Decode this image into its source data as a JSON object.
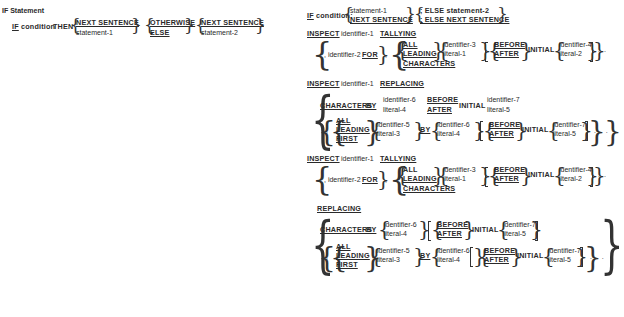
{
  "if_statement": {
    "title": "IF Statement",
    "format1": {
      "if": "IF",
      "condition": "condition",
      "then": "THEN",
      "choice1": [
        "NEXT SENTENCE",
        "statement-1"
      ],
      "choice2": [
        "OTHERWISE",
        "ELSE"
      ],
      "choice3": [
        "NEXT SENTENCE",
        "statement-2"
      ]
    },
    "format2": {
      "if": "IF",
      "condition": "condition;",
      "choice1": [
        "statement-1",
        "NEXT SENTENCE"
      ],
      "choice2": [
        "; ELSE statement-2",
        "; ELSE NEXT SENTENCE"
      ]
    }
  },
  "inspect_tallying": {
    "header": {
      "inspect": "INSPECT",
      "identifier": "identifier-1",
      "keyword": "TALLYING"
    },
    "identifier2": ", identifier-2",
    "for": "FOR",
    "comma": ",",
    "options": [
      "ALL",
      "LEADING",
      "CHARACTERS"
    ],
    "operand": [
      "identifier-3",
      "literal-1"
    ],
    "position": [
      "BEFORE",
      "AFTER"
    ],
    "initial": "INITIAL",
    "initial_operand": [
      "identifier-4",
      "literal-2"
    ],
    "ellipsis": ". . ."
  },
  "inspect_replacing": {
    "header": {
      "inspect": "INSPECT",
      "identifier": "identifier-1",
      "keyword": "REPLACING"
    },
    "characters_by": {
      "characters": "CHARACTERS",
      "by": "BY",
      "operand": [
        "identifier-6",
        "literal-4"
      ],
      "position": [
        "BEFORE",
        "AFTER"
      ],
      "initial": "INITIAL",
      "initial_operand": [
        "identifier-7",
        "literal-5"
      ]
    },
    "second_line": {
      "comma": ",",
      "options": [
        "ALL",
        "LEADING",
        "FIRST"
      ],
      "operand": [
        "identifier-5",
        "literal-3"
      ],
      "by": "BY",
      "replace_operand": [
        "identifier-6",
        "literal-4"
      ],
      "position": [
        "BEFORE",
        "AFTER"
      ],
      "initial": "INITIAL",
      "initial_operand": [
        "identifier-7",
        "literal-5"
      ]
    },
    "ellipsis": ". . ."
  },
  "inspect_tallying_replacing": {
    "header": {
      "inspect": "INSPECT",
      "identifier": "identifier-1",
      "keyword": "TALLYING"
    },
    "identifier2": ", identifier-2",
    "for": "FOR",
    "comma": ",",
    "options": [
      "ALL",
      "LEADING",
      "CHARACTERS"
    ],
    "operand": [
      "identifier-3",
      "literal-1"
    ],
    "position": [
      "BEFORE",
      "AFTER"
    ],
    "initial": "INITIAL",
    "initial_operand": [
      "identifier-4",
      "literal-2"
    ],
    "ellipsis": ". . .",
    "replacing": "REPLACING",
    "characters_by": {
      "characters": "CHARACTERS",
      "by": "BY",
      "operand": [
        "identifier-6",
        "literal-4"
      ],
      "position": [
        "BEFORE",
        "AFTER"
      ],
      "initial": "INITIAL",
      "initial_operand": [
        "identifier-7",
        "literal-5"
      ]
    },
    "second_line": {
      "comma": ",",
      "options": [
        "ALL",
        "LEADING",
        "FIRST"
      ],
      "operand": [
        "identifier-5",
        "literal-3"
      ],
      "by": "BY",
      "replace_operand": [
        "identifier-6",
        "literal-4"
      ],
      "position": [
        "BEFORE",
        "AFTER"
      ],
      "initial": "INITIAL",
      "initial_operand": [
        "identifier-7",
        "literal-5"
      ]
    }
  }
}
